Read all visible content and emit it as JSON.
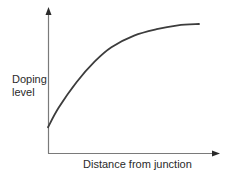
{
  "chart_data": {
    "type": "line",
    "title": "",
    "xlabel": "Distance from junction",
    "ylabel_lines": [
      "Doping",
      "level"
    ],
    "ylabel": "Doping level",
    "grid": false,
    "ticks": false,
    "legend": null,
    "series": [
      {
        "name": "Doping level",
        "description": "Concave-down rising curve starting above zero and saturating toward a plateau",
        "x": [
          0.0,
          0.07,
          0.19,
          0.31,
          0.42,
          0.57,
          0.72,
          0.86,
          1.0
        ],
        "y": [
          0.2,
          0.35,
          0.55,
          0.71,
          0.82,
          0.91,
          0.96,
          0.99,
          1.0
        ]
      }
    ],
    "axes": {
      "x_arrow": true,
      "y_arrow": true
    }
  },
  "colors": {
    "axis": "#7a7a7a",
    "curve": "#3c3c3c",
    "text": "#2a2a2a"
  }
}
